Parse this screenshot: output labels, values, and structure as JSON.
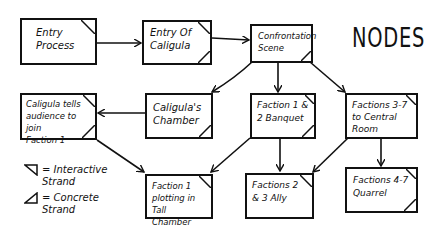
{
  "title": "NODES",
  "nodes": [
    {
      "id": "entry-process",
      "label": "Entry\nProcess",
      "corners": [
        "tr"
      ]
    },
    {
      "id": "entry-of-caligula",
      "label": "Entry Of\nCaligula",
      "corners": [
        "tr",
        "br"
      ]
    },
    {
      "id": "confrontation-scene",
      "label": "Confrontation\nScene",
      "corners": [
        "br"
      ]
    },
    {
      "id": "caligula-tells",
      "label": "Caligula tells\naudience to join\nFaction 1",
      "corners": [
        "tr",
        "br"
      ]
    },
    {
      "id": "caligulas-chamber",
      "label": "Caligula's\nChamber",
      "corners": [
        "br"
      ]
    },
    {
      "id": "faction-1-2-banquet",
      "label": "Faction 1 &\n2 Banquet",
      "corners": [
        "tr",
        "br"
      ]
    },
    {
      "id": "factions-3-7-central",
      "label": "Factions 3-7\nto Central\nRoom",
      "corners": [
        "tr"
      ]
    },
    {
      "id": "faction-1-plotting",
      "label": "Faction 1\nplotting in\nTall Chamber",
      "corners": [
        "tr"
      ]
    },
    {
      "id": "factions-2-3-ally",
      "label": "Factions 2\n& 3 Ally",
      "corners": [
        "tr"
      ]
    },
    {
      "id": "factions-4-7-quarrel",
      "label": "Factions 4-7\nQuarrel",
      "corners": [
        "tr",
        "br"
      ]
    }
  ],
  "edges": [
    {
      "from": "entry-process",
      "to": "entry-of-caligula"
    },
    {
      "from": "entry-of-caligula",
      "to": "confrontation-scene"
    },
    {
      "from": "confrontation-scene",
      "to": "caligulas-chamber"
    },
    {
      "from": "confrontation-scene",
      "to": "faction-1-2-banquet"
    },
    {
      "from": "confrontation-scene",
      "to": "factions-3-7-central"
    },
    {
      "from": "caligulas-chamber",
      "to": "caligula-tells"
    },
    {
      "from": "caligula-tells",
      "to": "faction-1-plotting"
    },
    {
      "from": "faction-1-2-banquet",
      "to": "faction-1-plotting"
    },
    {
      "from": "faction-1-2-banquet",
      "to": "factions-2-3-ally"
    },
    {
      "from": "factions-3-7-central",
      "to": "factions-2-3-ally"
    },
    {
      "from": "factions-3-7-central",
      "to": "factions-4-7-quarrel"
    }
  ],
  "legend": [
    {
      "symbol": "interactive-triangle",
      "label": "= Interactive\n   Strand"
    },
    {
      "symbol": "concrete-triangle",
      "label": "= Concrete\n   Strand"
    }
  ]
}
